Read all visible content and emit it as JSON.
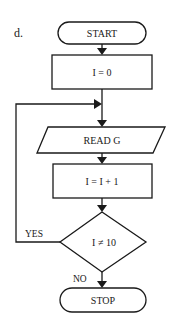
{
  "figure_label": "d.",
  "nodes": {
    "start": {
      "text": "START",
      "shape": "terminator"
    },
    "init": {
      "text": "I = 0",
      "shape": "process"
    },
    "read": {
      "text": "READ G",
      "shape": "input-output"
    },
    "increment": {
      "text": "I = I + 1",
      "shape": "process"
    },
    "decision": {
      "text": "I ≠ 10",
      "shape": "decision"
    },
    "stop": {
      "text": "STOP",
      "shape": "terminator"
    }
  },
  "edges": {
    "yes_label": "YES",
    "no_label": "NO"
  },
  "colors": {
    "stroke": "#1a1a1a",
    "background": "#ffffff"
  }
}
